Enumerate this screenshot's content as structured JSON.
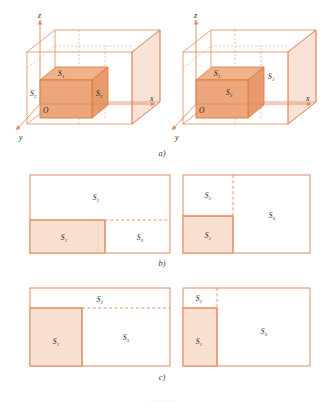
{
  "figure": {
    "rows": [
      {
        "id": "a",
        "label": "a)",
        "type": "3d-boxes",
        "panels": [
          {
            "id": "a-left",
            "name": "left-3d-box",
            "axes": {
              "x": "x",
              "y": "y",
              "z": "z"
            },
            "origin_label": "O",
            "region_labels": [
              "S₁",
              "S₂",
              "S₃"
            ],
            "shaded_regions": [
              "inner-cube",
              "outer-right-face"
            ],
            "description": "Inner shaded cube at origin inside a larger transparent box; S₁ on top face, S₂ on left face, S₃ on right."
          },
          {
            "id": "a-right",
            "name": "right-3d-box",
            "axes": {
              "x": "x",
              "y": "y",
              "z": "z"
            },
            "origin_label": "O",
            "region_labels": [
              "S₁",
              "S₂",
              "S₃"
            ],
            "shaded_regions": [
              "inner-cube",
              "outer-right-face"
            ],
            "description": "Inner shaded cube at origin; S₁ above cube, S₃ on cube front-right, S₂ on far right face."
          }
        ]
      },
      {
        "id": "b",
        "label": "b)",
        "type": "2d-rectangles",
        "panels": [
          {
            "id": "b-left",
            "name": "rect-diagram-b-left",
            "cells": [
              {
                "label": "S₂",
                "shaded": false,
                "position": "top-full-width"
              },
              {
                "label": "S₁",
                "shaded": true,
                "position": "bottom-left"
              },
              {
                "label": "S₃",
                "shaded": false,
                "position": "bottom-right"
              }
            ],
            "dashed_edges": [
              "horizontal-right-of-S1"
            ]
          },
          {
            "id": "b-right",
            "name": "rect-diagram-b-right",
            "cells": [
              {
                "label": "S₂",
                "shaded": false,
                "position": "top-left"
              },
              {
                "label": "S₁",
                "shaded": true,
                "position": "bottom-left"
              },
              {
                "label": "S₃",
                "shaded": false,
                "position": "right-full-height"
              }
            ],
            "dashed_edges": [
              "vertical-above-S1"
            ]
          }
        ]
      },
      {
        "id": "c",
        "label": "c)",
        "type": "2d-rectangles",
        "panels": [
          {
            "id": "c-left",
            "name": "rect-diagram-c-left",
            "cells": [
              {
                "label": "S₂",
                "shaded": false,
                "position": "top-full-width-thin"
              },
              {
                "label": "S₁",
                "shaded": true,
                "position": "bottom-left-tall"
              },
              {
                "label": "S₃",
                "shaded": false,
                "position": "bottom-right-large"
              }
            ],
            "dashed_edges": [
              "horizontal-right-of-S1"
            ]
          },
          {
            "id": "c-right",
            "name": "rect-diagram-c-right",
            "cells": [
              {
                "label": "S₂",
                "shaded": false,
                "position": "top-left-small"
              },
              {
                "label": "S₁",
                "shaded": true,
                "position": "bottom-left-tall"
              },
              {
                "label": "S₃",
                "shaded": false,
                "position": "right-full-height"
              }
            ],
            "dashed_edges": [
              "vertical-above-S1"
            ]
          }
        ]
      }
    ],
    "bottom_caption": "··········",
    "colors": {
      "stroke": "#e08a5f",
      "stroke_light": "#f0b99a",
      "fill_strong": "#e8a87c",
      "fill_medium": "#f3c9ae",
      "fill_light": "#fae3d6",
      "fill_faint": "#fdf1ea",
      "text": "#231f20"
    }
  }
}
